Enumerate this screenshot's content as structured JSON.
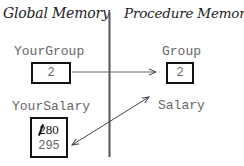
{
  "headers": {
    "global": "Global Memory",
    "procedure": "Procedure Memory"
  },
  "global": {
    "group": {
      "name": "YourGroup",
      "value": "2"
    },
    "salary": {
      "name": "YourSalary",
      "old_value": "280",
      "new_value": "295"
    }
  },
  "procedure": {
    "group": {
      "name": "Group",
      "value": "2"
    },
    "salary": {
      "name": "Salary"
    }
  },
  "arrows": [
    {
      "from": "YourGroup",
      "to": "Group",
      "type": "single-head",
      "meaning": "copy by value"
    },
    {
      "from": "Salary",
      "to": "YourSalary",
      "type": "double-head",
      "meaning": "reference"
    }
  ],
  "colors": {
    "text": "#666666",
    "box_border": "#111111",
    "divider": "#555555",
    "arrow": "#444444"
  }
}
